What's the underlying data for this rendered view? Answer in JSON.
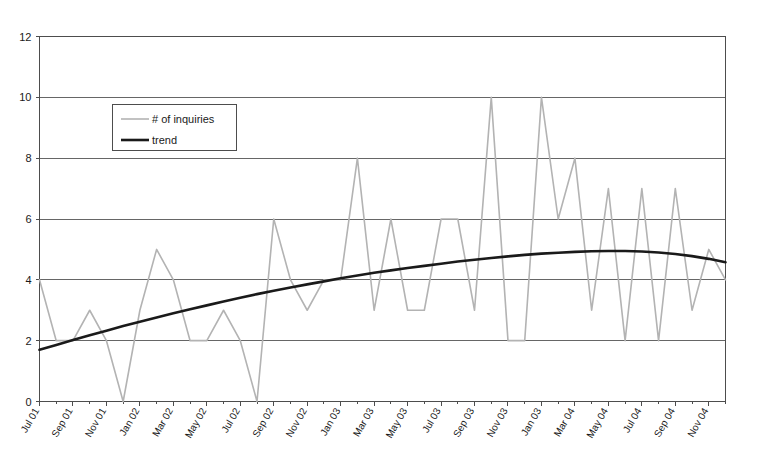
{
  "chart_data": {
    "type": "line",
    "title": "",
    "xlabel": "",
    "ylabel": "",
    "ylim": [
      0,
      12
    ],
    "yticks": [
      0,
      2,
      4,
      6,
      8,
      10,
      12
    ],
    "grid": true,
    "legend_position": "upper-left-inside",
    "x": [
      "Jul 01",
      "Aug 01",
      "Sep 01",
      "Oct 01",
      "Nov 01",
      "Dec 01",
      "Jan 02",
      "Feb 02",
      "Mar 02",
      "Apr 02",
      "May 02",
      "Jun 02",
      "Jul 02",
      "Aug 02",
      "Sep 02",
      "Oct 02",
      "Nov 02",
      "Dec 02",
      "Jan 03",
      "Feb 03",
      "Mar 03",
      "Apr 03",
      "May 03",
      "Jun 03",
      "Jul 03",
      "Aug 03",
      "Sep 03",
      "Oct 03",
      "Nov 03",
      "Dec 03",
      "Jan 03",
      "Feb 04",
      "Mar 04",
      "Apr 04",
      "May 04",
      "Jun 04",
      "Jul 04",
      "Aug 04",
      "Sep 04",
      "Oct 04",
      "Nov 04",
      "Dec 04"
    ],
    "xtick_labels": [
      "Jul 01",
      "Sep 01",
      "Nov 01",
      "Jan 02",
      "Mar 02",
      "May 02",
      "Jul 02",
      "Sep 02",
      "Nov 02",
      "Jan 03",
      "Mar 03",
      "May 03",
      "Jul 03",
      "Sep 03",
      "Nov 03",
      "Jan 03",
      "Mar 04",
      "May 04",
      "Jul 04",
      "Sep 04",
      "Nov 04"
    ],
    "xtick_indices": [
      0,
      2,
      4,
      6,
      8,
      10,
      12,
      14,
      16,
      18,
      20,
      22,
      24,
      26,
      28,
      30,
      32,
      34,
      36,
      38,
      40
    ],
    "series": [
      {
        "name": "# of inquiries",
        "color": "#b3b3b3",
        "width": 1.6,
        "values": [
          4,
          2,
          2,
          3,
          2,
          0,
          3,
          5,
          4,
          2,
          2,
          3,
          2,
          0,
          6,
          4,
          3,
          4,
          4,
          8,
          3,
          6,
          3,
          3,
          6,
          6,
          3,
          10,
          2,
          2,
          10,
          6,
          8,
          3,
          7,
          2,
          7,
          2,
          7,
          3,
          5,
          4
        ]
      },
      {
        "name": "trend",
        "color": "#1a1a1a",
        "width": 2.6,
        "values": [
          1.7,
          1.86,
          2.02,
          2.18,
          2.33,
          2.48,
          2.62,
          2.76,
          2.9,
          3.03,
          3.16,
          3.29,
          3.41,
          3.53,
          3.64,
          3.75,
          3.85,
          3.95,
          4.05,
          4.14,
          4.23,
          4.31,
          4.39,
          4.46,
          4.53,
          4.6,
          4.66,
          4.72,
          4.77,
          4.82,
          4.86,
          4.89,
          4.92,
          4.94,
          4.95,
          4.95,
          4.93,
          4.9,
          4.85,
          4.78,
          4.69,
          4.58
        ]
      }
    ]
  },
  "legend": {
    "entries": [
      {
        "label": "# of inquiries",
        "marker": "thin-gray-line"
      },
      {
        "label": "trend",
        "marker": "thick-black-line"
      }
    ]
  },
  "colors": {
    "plot_background": "#ffffff",
    "axis": "#4d4d4d",
    "gridline": "#555555",
    "inquiries": "#b3b3b3",
    "trend": "#1a1a1a"
  }
}
